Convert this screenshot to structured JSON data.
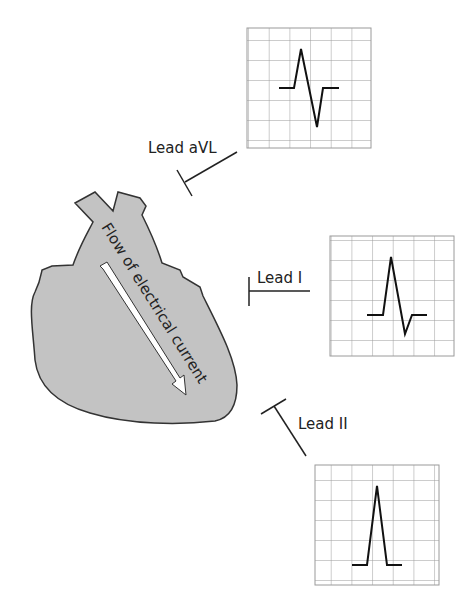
{
  "diagram": {
    "heart": {
      "label": "Flow of electrical current",
      "fill": "#c3c3c3",
      "stroke": "#333333"
    },
    "leads": [
      {
        "id": "aVL",
        "label": "Lead aVL",
        "waveform": "biphasic (positive then negative deflection)"
      },
      {
        "id": "I",
        "label": "Lead I",
        "waveform": "mostly positive with small negative deflection"
      },
      {
        "id": "II",
        "label": "Lead II",
        "waveform": "tall positive deflection"
      }
    ],
    "grid": {
      "rows": 6,
      "cols": 6,
      "line_color": "#9a9a9a"
    },
    "trace_color": "#111111"
  }
}
